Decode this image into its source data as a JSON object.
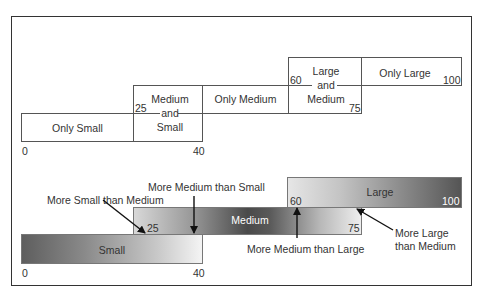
{
  "top_diagram": {
    "regions": [
      {
        "label": "Only Small",
        "from": 0,
        "to": 25
      },
      {
        "label_lines": [
          "Medium",
          "and",
          "Small"
        ],
        "from": 25,
        "to": 40
      },
      {
        "label": "Only Medium",
        "from": 40,
        "to": 60
      },
      {
        "label_lines": [
          "Large",
          "and",
          "Medium"
        ],
        "from": 60,
        "to": 75
      },
      {
        "label": "Only Large",
        "from": 75,
        "to": 100
      }
    ],
    "ticks": {
      "t0": "0",
      "t25": "25",
      "t40": "40",
      "t60": "60",
      "t75": "75",
      "t100": "100"
    }
  },
  "bottom_diagram": {
    "bars": {
      "small": {
        "label": "Small",
        "from": 0,
        "to": 40,
        "start_label": "0",
        "end_label": "40"
      },
      "medium": {
        "label": "Medium",
        "from": 25,
        "to": 75,
        "start_label": "25",
        "end_label": "75"
      },
      "large": {
        "label": "Large",
        "from": 60,
        "to": 100,
        "start_label": "60",
        "end_label": "100"
      }
    },
    "annotations": {
      "more_small_than_medium": "More Small than Medium",
      "more_medium_than_small": "More Medium than Small",
      "more_medium_than_large": "More Medium than Large",
      "more_large_than_medium_line1": "More Large",
      "more_large_than_medium_line2": "than Medium"
    }
  }
}
